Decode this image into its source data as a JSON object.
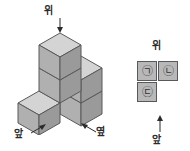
{
  "figure": {
    "name": "isometric-cube-stack",
    "cube_count": 4,
    "face_colors": {
      "top": "#d4d4d4",
      "left": "#b0b0b0",
      "right": "#9a9a9a",
      "outline": "#58595b"
    },
    "labels": {
      "top": "위",
      "front": "앞",
      "side": "옆"
    }
  },
  "top_view": {
    "label": "위",
    "front_label": "앞",
    "rows": [
      [
        {
          "mark": "㉠",
          "filled": true
        },
        {
          "mark": "㉡",
          "filled": true
        }
      ],
      [
        {
          "mark": "㉢",
          "filled": true
        },
        {
          "mark": "",
          "filled": false
        }
      ]
    ],
    "cell_fill": "#b8b8b8",
    "cell_border": "#58595b"
  },
  "icons": {
    "arrow_down": "arrow-down-icon",
    "arrow_up": "arrow-up-icon",
    "arrow_diagonal_front": "arrow-diagonal-front-icon",
    "arrow_diagonal_side": "arrow-diagonal-side-icon"
  }
}
